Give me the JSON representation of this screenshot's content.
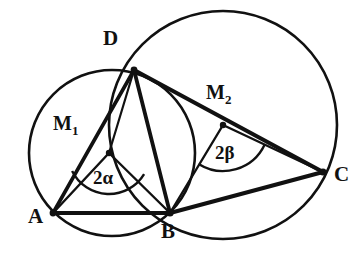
{
  "figure": {
    "type": "euclidean-geometry-diagram",
    "background_color": "#ffffff",
    "stroke_color": "#111111"
  },
  "labels": {
    "point_a": "A",
    "point_b": "B",
    "point_c": "C",
    "point_d": "D",
    "center_1": "M",
    "center_1_sub": "1",
    "center_2": "M",
    "center_2_sub": "2",
    "angle_1": "2α",
    "angle_2": "2β"
  },
  "points": {
    "A": {
      "x": 53,
      "y": 213
    },
    "B": {
      "x": 170,
      "y": 213
    },
    "C": {
      "x": 323,
      "y": 172
    },
    "D": {
      "x": 134,
      "y": 70
    },
    "M1": {
      "x": 109,
      "y": 153
    },
    "M2": {
      "x": 223,
      "y": 125
    }
  },
  "label_positions": {
    "A": {
      "x": 28,
      "y": 206
    },
    "B": {
      "x": 161,
      "y": 221
    },
    "C": {
      "x": 334,
      "y": 164
    },
    "D": {
      "x": 103,
      "y": 28
    },
    "M1": {
      "x": 53,
      "y": 113
    },
    "M2": {
      "x": 206,
      "y": 82
    },
    "angle_1": {
      "x": 93,
      "y": 168
    },
    "angle_2": {
      "x": 215,
      "y": 143
    }
  },
  "circles": [
    {
      "name": "circle-m1",
      "cx": 112,
      "cy": 153,
      "r": 83,
      "through": [
        "A",
        "D",
        "B"
      ]
    },
    {
      "name": "circle-m2",
      "cx": 223,
      "cy": 125,
      "r": 114,
      "through": [
        "D",
        "B",
        "C"
      ]
    }
  ],
  "segments": [
    {
      "name": "segment-ab",
      "from": "A",
      "to": "B",
      "weight": "thick"
    },
    {
      "name": "segment-ad",
      "from": "A",
      "to": "D",
      "weight": "thick"
    },
    {
      "name": "segment-am1",
      "from": "A",
      "to": "M1",
      "weight": "thin"
    },
    {
      "name": "segment-m1b",
      "from": "M1",
      "to": "B",
      "weight": "thin"
    },
    {
      "name": "segment-m1d",
      "from": "M1",
      "to": "D",
      "weight": "thin"
    },
    {
      "name": "segment-db",
      "from": "D",
      "to": "B",
      "weight": "thick"
    },
    {
      "name": "segment-dc",
      "from": "D",
      "to": "C",
      "weight": "thick"
    },
    {
      "name": "segment-bc",
      "from": "B",
      "to": "C",
      "weight": "thick"
    },
    {
      "name": "segment-m2b",
      "from": "M2",
      "to": "B",
      "weight": "thin"
    },
    {
      "name": "segment-m2c",
      "from": "M2",
      "to": "C",
      "weight": "thin"
    }
  ],
  "angle_arcs": [
    {
      "name": "arc-2alpha",
      "vertex": "M1",
      "radius": 41,
      "from_deg": 154,
      "to_deg": 31
    },
    {
      "name": "arc-2beta",
      "vertex": "M2",
      "radius": 46,
      "from_deg": 122,
      "to_deg": 25
    }
  ],
  "vertex_dots": [
    "A",
    "B",
    "C",
    "D",
    "M1",
    "M2"
  ]
}
